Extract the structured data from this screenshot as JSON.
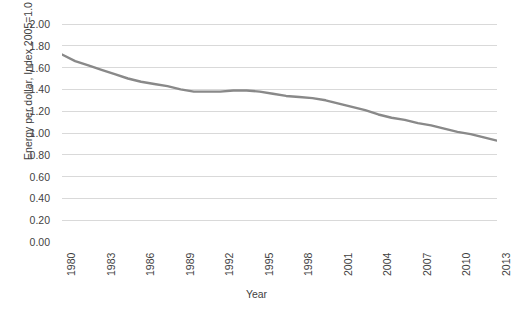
{
  "chart_data": {
    "type": "line",
    "title": "",
    "xlabel": "Year",
    "ylabel": "Energy per dollar, Index 2005=1.0",
    "xlim": [
      1980,
      2013
    ],
    "ylim": [
      0.0,
      2.0
    ],
    "y_ticks": [
      "0.00",
      "0.20",
      "0.40",
      "0.60",
      "0.80",
      "1.00",
      "1.20",
      "1.40",
      "1.60",
      "1.80",
      "2.00"
    ],
    "y_tick_values": [
      0.0,
      0.2,
      0.4,
      0.6,
      0.8,
      1.0,
      1.2,
      1.4,
      1.6,
      1.8,
      2.0
    ],
    "x_ticks": [
      "1980",
      "1983",
      "1986",
      "1989",
      "1992",
      "1995",
      "1998",
      "2001",
      "2004",
      "2007",
      "2010",
      "2013"
    ],
    "x_tick_values": [
      1980,
      1983,
      1986,
      1989,
      1992,
      1995,
      1998,
      2001,
      2004,
      2007,
      2010,
      2013
    ],
    "x_tick_interval": 3,
    "grid": "horizontal",
    "legend": "none",
    "series_color": "#898989",
    "grid_color": "#d9d9d9",
    "x": [
      1980,
      1981,
      1982,
      1983,
      1984,
      1985,
      1986,
      1987,
      1988,
      1989,
      1990,
      1991,
      1992,
      1993,
      1994,
      1995,
      1996,
      1997,
      1998,
      1999,
      2000,
      2001,
      2002,
      2003,
      2004,
      2005,
      2006,
      2007,
      2008,
      2009,
      2010,
      2011,
      2012,
      2013
    ],
    "values": [
      1.72,
      1.66,
      1.62,
      1.58,
      1.54,
      1.5,
      1.47,
      1.45,
      1.43,
      1.4,
      1.38,
      1.38,
      1.38,
      1.39,
      1.39,
      1.38,
      1.36,
      1.34,
      1.33,
      1.32,
      1.3,
      1.27,
      1.24,
      1.21,
      1.17,
      1.14,
      1.12,
      1.09,
      1.07,
      1.04,
      1.01,
      0.99,
      0.96,
      0.93
    ],
    "series": [
      {
        "name": "Energy per dollar",
        "values": [
          1.72,
          1.66,
          1.62,
          1.58,
          1.54,
          1.5,
          1.47,
          1.45,
          1.43,
          1.4,
          1.38,
          1.38,
          1.38,
          1.39,
          1.39,
          1.38,
          1.36,
          1.34,
          1.33,
          1.32,
          1.3,
          1.27,
          1.24,
          1.21,
          1.17,
          1.14,
          1.12,
          1.09,
          1.07,
          1.04,
          1.01,
          0.99,
          0.96,
          0.93
        ]
      }
    ]
  }
}
